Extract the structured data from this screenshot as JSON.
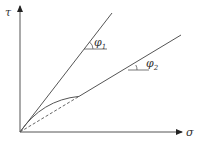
{
  "diagram": {
    "type": "mohr-coulomb-failure-envelope",
    "axes": {
      "y_label": "τ",
      "x_label": "σ"
    },
    "lines": [
      {
        "name": "peak-envelope",
        "angle_label": "φ",
        "angle_subscript": "1"
      },
      {
        "name": "residual-envelope",
        "angle_label": "φ",
        "angle_subscript": "2"
      }
    ],
    "curve": {
      "name": "curved-envelope",
      "style": "solid"
    },
    "dashed_line": {
      "name": "linear-extrapolation",
      "style": "dashed"
    },
    "colors": {
      "stroke": "#444444",
      "background": "#ffffff"
    }
  }
}
